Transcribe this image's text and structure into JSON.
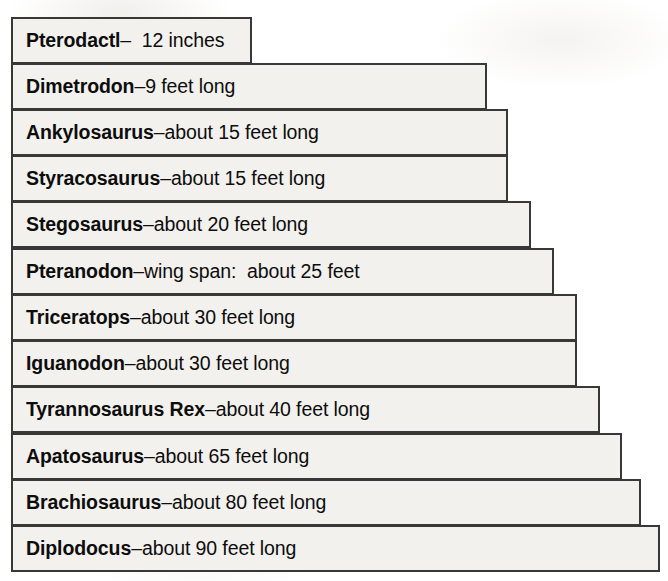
{
  "figure": {
    "background_color": "#ffffff",
    "bar_fill_color": "#f3f1ee",
    "bar_border_color": "#383838",
    "text_color": "#0d0d0d"
  },
  "chart_data": {
    "type": "bar",
    "xlabel": "",
    "ylabel": "",
    "orientation": "horizontal",
    "grid": false,
    "legend": "none",
    "units": "feet",
    "categories": [
      "Pterodactl",
      "Dimetrodon",
      "Ankylosaurus",
      "Styracosaurus",
      "Stegosaurus",
      "Pteranodon",
      "Triceratops",
      "Iguanodon",
      "Tyrannosaurus Rex",
      "Apatosaurus",
      "Brachiosaurus",
      "Diplodocus"
    ],
    "values": [
      1,
      9,
      15,
      15,
      20,
      25,
      30,
      30,
      40,
      65,
      80,
      90
    ],
    "value_labels": [
      "12 inches",
      "9 feet long",
      "about 15 feet long",
      "about 15 feet long",
      "about 20 feet long",
      "wing span:  about 25 feet",
      "about 30 feet long",
      "about 30 feet long",
      "about 40 feet long",
      "about 65 feet long",
      "about 80 feet long",
      "about 90 feet long"
    ],
    "xlim": [
      0,
      90
    ]
  },
  "rows": [
    {
      "name": "Pterodactl",
      "separator": "–",
      "description": "  12 inches",
      "bar_width_px": 241,
      "top_px": 17
    },
    {
      "name": "Dimetrodon",
      "separator": "–",
      "description": "9 feet long",
      "bar_width_px": 476,
      "top_px": 63
    },
    {
      "name": "Ankylosaurus",
      "separator": "–",
      "description": "about 15 feet long",
      "bar_width_px": 497,
      "top_px": 109
    },
    {
      "name": "Styracosaurus",
      "separator": "–",
      "description": "about 15 feet long",
      "bar_width_px": 497,
      "top_px": 155
    },
    {
      "name": "Stegosaurus",
      "separator": "–",
      "description": "about 20 feet long",
      "bar_width_px": 520,
      "top_px": 201
    },
    {
      "name": "Pteranodon",
      "separator": "–",
      "description": "wing span:  about 25 feet",
      "bar_width_px": 543,
      "top_px": 248
    },
    {
      "name": "Triceratops",
      "separator": "–",
      "description": "about 30 feet long",
      "bar_width_px": 566,
      "top_px": 294
    },
    {
      "name": "Iguanodon",
      "separator": "–",
      "description": "about 30 feet long",
      "bar_width_px": 566,
      "top_px": 340
    },
    {
      "name": "Tyrannosaurus Rex",
      "separator": "–",
      "description": "about 40 feet long",
      "bar_width_px": 589,
      "top_px": 386
    },
    {
      "name": "Apatosaurus",
      "separator": "–",
      "description": "about 65 feet long",
      "bar_width_px": 611,
      "top_px": 433
    },
    {
      "name": "Brachiosaurus",
      "separator": "–",
      "description": "about 80 feet long",
      "bar_width_px": 630,
      "top_px": 479
    },
    {
      "name": "Diplodocus",
      "separator": "–",
      "description": "about 90 feet long",
      "bar_width_px": 649,
      "top_px": 525
    }
  ]
}
